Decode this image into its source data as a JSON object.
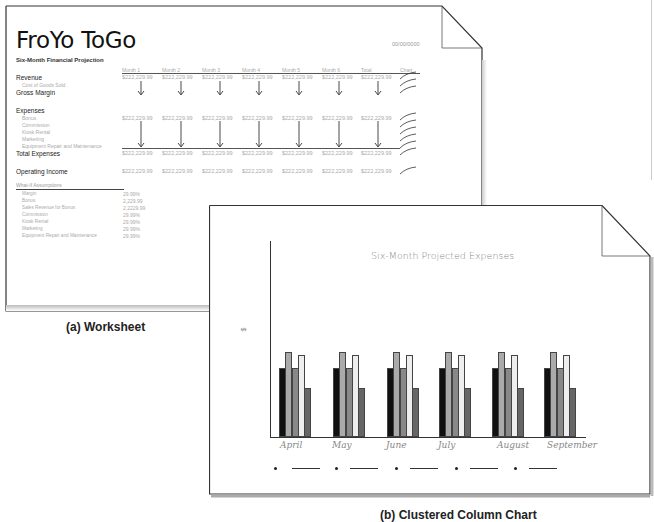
{
  "worksheet": {
    "title": "FroYo ToGo",
    "subtitle": "Six-Month Financial Projection",
    "date": "00/00/0000",
    "columns": [
      "Month 1",
      "Month 2",
      "Month 3",
      "Month 4",
      "Month 5",
      "Month 6",
      "Total",
      "Chart"
    ],
    "rows": {
      "revenue": {
        "label": "Revenue",
        "value": "$222,229.99"
      },
      "cost_of_goods_sold": {
        "label": "Cost of Goods Sold"
      },
      "gross_margin": {
        "label": "Gross Margin"
      },
      "expenses": {
        "label": "Expenses"
      },
      "bonus": {
        "label": "Bonus",
        "value": "$222,229.99"
      },
      "commission": {
        "label": "Commission"
      },
      "kiosk_rental": {
        "label": "Kiosk Rental"
      },
      "marketing": {
        "label": "Marketing"
      },
      "equipment": {
        "label": "Equipment Repair and Maintenance"
      },
      "total_expenses": {
        "label": "Total Expenses",
        "value": "$222,229.99"
      },
      "operating_income": {
        "label": "Operating Income",
        "value": "$222,229.99"
      }
    },
    "assumptions": {
      "header": "What-If Assumptions",
      "items": [
        {
          "label": "Margin",
          "value": "29.99%"
        },
        {
          "label": "Bonus",
          "value": "2,229.99"
        },
        {
          "label": "Sales Revenue for Bonus",
          "value": "2,2229.99"
        },
        {
          "label": "Commission",
          "value": "29.99%"
        },
        {
          "label": "Kiosk Rental",
          "value": "29.99%"
        },
        {
          "label": "Marketing",
          "value": "29.99%"
        },
        {
          "label": "Equipment Repair and Maintenance",
          "value": "29.99%"
        }
      ]
    }
  },
  "captions": {
    "worksheet": "(a) Worksheet",
    "chart": "(b) Clustered Column Chart"
  },
  "chart_data": {
    "type": "bar",
    "title": "Six-Month Projected Expenses",
    "xlabel": "",
    "ylabel": "$",
    "categories": [
      "April",
      "May",
      "June",
      "July",
      "August",
      "September"
    ],
    "series": [
      {
        "name": "Series 1",
        "color": "#111111",
        "values": [
          69,
          69,
          69,
          69,
          69,
          69
        ]
      },
      {
        "name": "Series 2",
        "color": "#aaaaaa",
        "values": [
          85,
          85,
          85,
          85,
          85,
          85
        ]
      },
      {
        "name": "Series 3",
        "color": "#888888",
        "values": [
          69,
          69,
          69,
          69,
          69,
          69
        ]
      },
      {
        "name": "Series 4",
        "color": "#eeeeee",
        "values": [
          82,
          82,
          82,
          82,
          82,
          82
        ]
      },
      {
        "name": "Series 5",
        "color": "#666666",
        "values": [
          49,
          49,
          49,
          49,
          49,
          49
        ]
      }
    ],
    "legend_placeholders": 5,
    "grid": false
  }
}
